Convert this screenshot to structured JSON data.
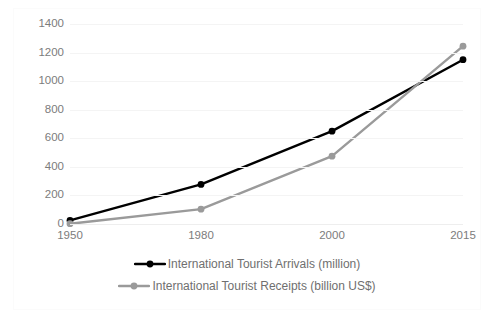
{
  "chart_data": {
    "type": "line",
    "title": "",
    "subtitle": "",
    "xlabel": "",
    "ylabel": "",
    "categories": [
      "1950",
      "1980",
      "2000",
      "2015"
    ],
    "x_tick_labels": [
      "1950",
      "1980",
      "2000",
      "2015"
    ],
    "y_tick_labels": [
      "1400",
      "1200",
      "1000",
      "800",
      "600",
      "400",
      "200",
      "0"
    ],
    "ylim": [
      0,
      1400
    ],
    "y_step": 200,
    "grid": true,
    "legend_position": "bottom",
    "series": [
      {
        "name": "International Tourist Arrivals (million)",
        "color": "#000000",
        "marker": "circle",
        "values": [
          25,
          277,
          650,
          1150
        ]
      },
      {
        "name": "International Tourist Receipts (billion US$)",
        "color": "#9a9a9a",
        "marker": "circle",
        "values": [
          2,
          104,
          475,
          1245
        ]
      }
    ]
  },
  "legend": {
    "items": [
      {
        "label": "International Tourist Arrivals (million)",
        "color": "#000000"
      },
      {
        "label": "International Tourist Receipts (billion US$)",
        "color": "#9a9a9a"
      }
    ]
  },
  "colors": {
    "arrivals": "#000000",
    "receipts": "#9a9a9a",
    "gridline": "#f4f4f4",
    "tick_text": "#7c7c7c",
    "legend_text": "#6f6f6f",
    "background": "#ffffff",
    "border": "#fbfbfb"
  }
}
